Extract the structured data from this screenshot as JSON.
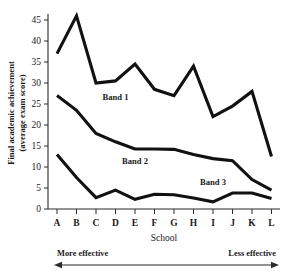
{
  "chart_data": {
    "type": "line",
    "title": "",
    "xlabel": "School",
    "ylabel": "Final academic achievement (average exam score)",
    "ylabel_line1": "Final academic achievement",
    "ylabel_line2": "(average exam score)",
    "categories": [
      "A",
      "B",
      "C",
      "D",
      "E",
      "F",
      "G",
      "H",
      "I",
      "J",
      "K",
      "L"
    ],
    "ylim": [
      0,
      47
    ],
    "yticks": [
      0,
      5,
      10,
      15,
      20,
      25,
      30,
      35,
      40,
      45
    ],
    "ytick_labels": [
      "0",
      "5",
      "10",
      "15",
      "20",
      "25",
      "30",
      "35",
      "40",
      "45"
    ],
    "grid": false,
    "legend_position": "inline-annotations",
    "series": [
      {
        "name": "Band 1",
        "label": "Band 1",
        "values": [
          37,
          46,
          30,
          30.5,
          34.5,
          28.5,
          27,
          34,
          22,
          24.5,
          28,
          12.5
        ]
      },
      {
        "name": "Band 2",
        "label": "Band 2",
        "values": [
          27,
          23.5,
          18,
          16,
          14.3,
          14.3,
          14.2,
          13,
          12,
          11.5,
          7,
          4.5
        ]
      },
      {
        "name": "Band 3",
        "label": "Band 3",
        "values": [
          13,
          7.5,
          2.7,
          4.5,
          2.3,
          3.5,
          3.4,
          2.6,
          1.7,
          3.8,
          3.8,
          2.5
        ]
      }
    ],
    "annotations": [
      {
        "text": "Band 1",
        "x_category": "D",
        "y_value": 26.0
      },
      {
        "text": "Band 2",
        "x_category": "E",
        "y_value": 10.6
      },
      {
        "text": "Band 3",
        "x_category": "I",
        "y_value": 5.8
      }
    ],
    "direction_axis": {
      "left_label": "More effective",
      "right_label": "Less effective",
      "arrow": "double-headed"
    },
    "colors": {
      "line": "#111111",
      "axis": "#2b2b2b",
      "text": "#1a1a1a",
      "background": "#ffffff"
    }
  }
}
